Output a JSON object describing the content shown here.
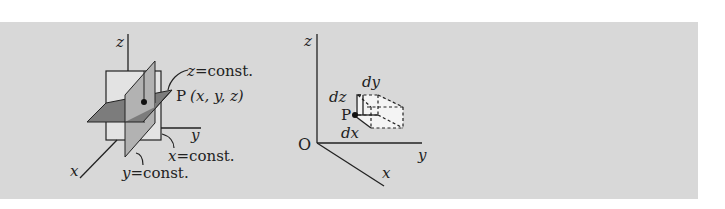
{
  "colors": {
    "panel_bg": "#d8d8d8",
    "axis": "#222222",
    "plane_x_const": "#e3e3e3",
    "plane_y_const": "#b2b2b2",
    "plane_z_const": "#7c7c7c",
    "box_fill": "#f4f4f4"
  },
  "left_figure": {
    "axis_labels": {
      "x": "x",
      "y": "y",
      "z": "z"
    },
    "plane_labels": {
      "z_const": {
        "var": "z",
        "eq": "=",
        "text": "const."
      },
      "x_const": {
        "var": "x",
        "eq": "=",
        "text": "const."
      },
      "y_const": {
        "var": "y",
        "eq": "=",
        "text": "const."
      }
    },
    "point_label": {
      "name": "P",
      "coords": "(x, y, z)"
    }
  },
  "right_figure": {
    "origin_label": "O",
    "axis_labels": {
      "x": "x",
      "y": "y",
      "z": "z"
    },
    "point_label": "P",
    "differentials": {
      "dx": "dx",
      "dy": "dy",
      "dz": "dz"
    }
  }
}
